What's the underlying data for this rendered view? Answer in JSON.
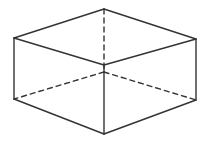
{
  "figure": {
    "stroke_color": "#333333",
    "background": "#ffffff",
    "vertices": {
      "top_back": [
        104,
        9
      ],
      "top_left": [
        14,
        38
      ],
      "top_right": [
        196,
        39
      ],
      "top_front": [
        104,
        65
      ],
      "bottom_left": [
        14,
        99
      ],
      "bottom_right": [
        196,
        100
      ],
      "bottom_front": [
        104,
        134
      ],
      "bottom_back": [
        104,
        72
      ]
    },
    "visible_edges": [
      [
        "top_back",
        "top_left"
      ],
      [
        "top_back",
        "top_right"
      ],
      [
        "top_left",
        "top_front"
      ],
      [
        "top_right",
        "top_front"
      ],
      [
        "top_left",
        "bottom_left"
      ],
      [
        "top_right",
        "bottom_right"
      ],
      [
        "top_front",
        "bottom_front"
      ],
      [
        "bottom_left",
        "bottom_front"
      ],
      [
        "bottom_right",
        "bottom_front"
      ]
    ],
    "hidden_edges": [
      [
        "top_back",
        "bottom_back"
      ],
      [
        "bottom_back",
        "bottom_left"
      ],
      [
        "bottom_back",
        "bottom_right"
      ]
    ]
  }
}
